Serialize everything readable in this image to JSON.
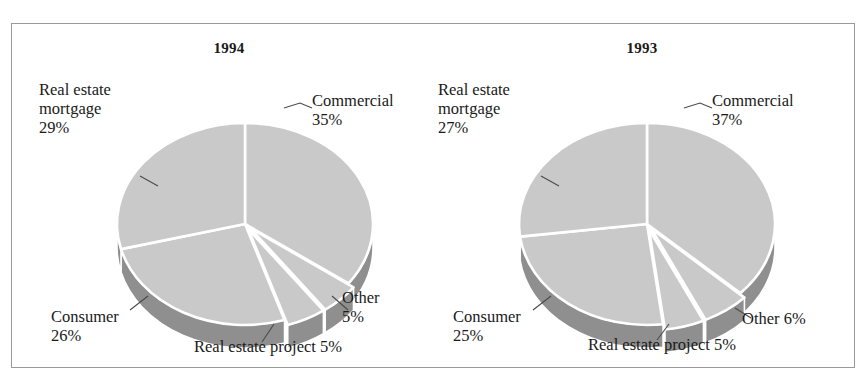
{
  "figure": {
    "background": "#ffffff",
    "border_color": "#9a9a9a",
    "pie_top_color": "#c9c9c9",
    "pie_side_color": "#8f8f8f",
    "separator_color": "#ffffff",
    "leader_line_color": "#4a4a4a",
    "text_color": "#1a1a1a"
  },
  "chart_data": [
    {
      "type": "pie",
      "title": "1994",
      "xlabel": "",
      "ylabel": "",
      "legend": "none",
      "grid": false,
      "labels": [
        "Commercial",
        "Other",
        "Real estate project",
        "Consumer",
        "Real estate mortgage"
      ],
      "values": [
        35,
        5,
        5,
        26,
        29
      ],
      "annotations": [
        {
          "key": "commercial",
          "text": "Commercial\n35%"
        },
        {
          "key": "other",
          "text": "Other\n5%"
        },
        {
          "key": "project",
          "text": "Real estate project 5%"
        },
        {
          "key": "consumer",
          "text": "Consumer\n26%"
        },
        {
          "key": "mortgage",
          "text": "Real estate\nmortgage\n29%"
        }
      ]
    },
    {
      "type": "pie",
      "title": "1993",
      "xlabel": "",
      "ylabel": "",
      "legend": "none",
      "grid": false,
      "labels": [
        "Commercial",
        "Other",
        "Real estate project",
        "Consumer",
        "Real estate mortgage"
      ],
      "values": [
        37,
        6,
        5,
        25,
        27
      ],
      "annotations": [
        {
          "key": "commercial",
          "text": "Commercial\n37%"
        },
        {
          "key": "other",
          "text": "Other 6%"
        },
        {
          "key": "project",
          "text": "Real estate project 5%"
        },
        {
          "key": "consumer",
          "text": "Consumer\n25%"
        },
        {
          "key": "mortgage",
          "text": "Real estate\nmortgage\n27%"
        }
      ]
    }
  ]
}
